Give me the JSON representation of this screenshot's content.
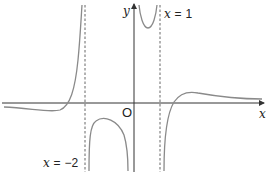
{
  "diagram": {
    "type": "graph-of-function",
    "axes": {
      "x_label": "x",
      "y_label": "y",
      "origin_label": "O"
    },
    "asymptotes": [
      {
        "equation_var": "x",
        "equals": "=",
        "value": "−2",
        "orientation": "vertical"
      },
      {
        "equation_var": "x",
        "equals": "=",
        "value": "1",
        "orientation": "vertical"
      }
    ],
    "colors": {
      "axis": "#333333",
      "curve": "#8a8a8a",
      "asymptote": "#555555"
    }
  }
}
